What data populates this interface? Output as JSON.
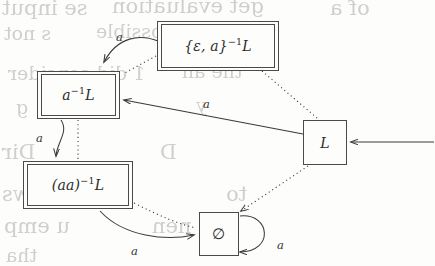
{
  "diagram": {
    "type": "finite-automaton",
    "states": [
      {
        "id": "eps-a-inv-L",
        "label_text": "{ε, a}⁻¹L",
        "base": "{ε, a}",
        "exponent": "−1",
        "suffix": "L",
        "accepting": true,
        "start": false,
        "x": 157,
        "y": 21,
        "w": 122,
        "h": 50
      },
      {
        "id": "a-inv-L",
        "label_text": "a⁻¹L",
        "base": "a",
        "exponent": "−1",
        "suffix": "L",
        "accepting": true,
        "start": false,
        "x": 37,
        "y": 71,
        "w": 83,
        "h": 48
      },
      {
        "id": "aa-inv-L",
        "label_text": "(aa)⁻¹L",
        "base": "(aa)",
        "exponent": "−1",
        "suffix": "L",
        "accepting": true,
        "start": false,
        "x": 23,
        "y": 161,
        "w": 110,
        "h": 48
      },
      {
        "id": "L",
        "label_text": "L",
        "base": "L",
        "exponent": "",
        "suffix": "",
        "accepting": false,
        "start": true,
        "x": 303,
        "y": 120,
        "w": 44,
        "h": 45
      },
      {
        "id": "empty-set",
        "label_text": "∅",
        "base": "∅",
        "exponent": "",
        "suffix": "",
        "accepting": false,
        "start": false,
        "x": 199,
        "y": 212,
        "w": 40,
        "h": 44
      }
    ],
    "transitions": [
      {
        "from": "eps-a-inv-L",
        "to": "a-inv-L",
        "symbol": "a",
        "style": "solid",
        "label_x": 116,
        "label_y": 30
      },
      {
        "from": "L",
        "to": "a-inv-L",
        "symbol": "a",
        "style": "solid",
        "label_x": 203,
        "label_y": 97
      },
      {
        "from": "a-inv-L",
        "to": "aa-inv-L",
        "symbol": "a",
        "style": "solid",
        "label_x": 36,
        "label_y": 131
      },
      {
        "from": "aa-inv-L",
        "to": "empty-set",
        "symbol": "a",
        "style": "solid",
        "label_x": 131,
        "label_y": 244
      },
      {
        "from": "empty-set",
        "to": "empty-set",
        "symbol": "a",
        "style": "solid",
        "label_x": 277,
        "label_y": 238,
        "self_loop": true
      }
    ],
    "refinement_links": [
      {
        "from": "eps-a-inv-L",
        "to": "a-inv-L",
        "style": "dotted"
      },
      {
        "from": "eps-a-inv-L",
        "to": "L",
        "style": "dotted"
      },
      {
        "from": "a-inv-L",
        "to": "aa-inv-L",
        "style": "dotted"
      },
      {
        "from": "aa-inv-L",
        "to": "empty-set",
        "style": "dotted"
      },
      {
        "from": "L",
        "to": "empty-set",
        "style": "dotted"
      }
    ],
    "start_arrow": {
      "from_x": 434,
      "to_x": 349,
      "y": 142
    },
    "colors": {
      "stroke": "#4a4a4a",
      "edge": "#3a3a3a",
      "text": "#2b2b2b",
      "background": "#fdfdfc",
      "ghost_text": "#c9c7c4"
    }
  },
  "background_artifacts": [
    {
      "text": "se input",
      "x": 2,
      "y": -4,
      "size": 21
    },
    {
      "text": "get  evaluation",
      "x": 112,
      "y": -6,
      "size": 21
    },
    {
      "text": "of a",
      "x": 330,
      "y": -4,
      "size": 21
    },
    {
      "text": "s not",
      "x": 4,
      "y": 22,
      "size": 19
    },
    {
      "text": "ple  as  possible",
      "x": 96,
      "y": 20,
      "size": 19
    },
    {
      "text": "1 did consider",
      "x": 8,
      "y": 62,
      "size": 19
    },
    {
      "text": "the  an",
      "x": 182,
      "y": 60,
      "size": 19
    },
    {
      "text": "g",
      "x": 16,
      "y": 96,
      "size": 19
    },
    {
      "text": "y",
      "x": 196,
      "y": 94,
      "size": 19
    },
    {
      "text": "Dir",
      "x": 2,
      "y": 140,
      "size": 21
    },
    {
      "text": "D",
      "x": 160,
      "y": 140,
      "size": 21
    },
    {
      "text": "2)  Use  a  ws",
      "x": 2,
      "y": 182,
      "size": 21
    },
    {
      "text": "to",
      "x": 226,
      "y": 182,
      "size": 21
    },
    {
      "text": "u  emp",
      "x": 4,
      "y": 214,
      "size": 21
    },
    {
      "text": "nen",
      "x": 152,
      "y": 214,
      "size": 21
    },
    {
      "text": "tha",
      "x": 6,
      "y": 244,
      "size": 19
    }
  ]
}
